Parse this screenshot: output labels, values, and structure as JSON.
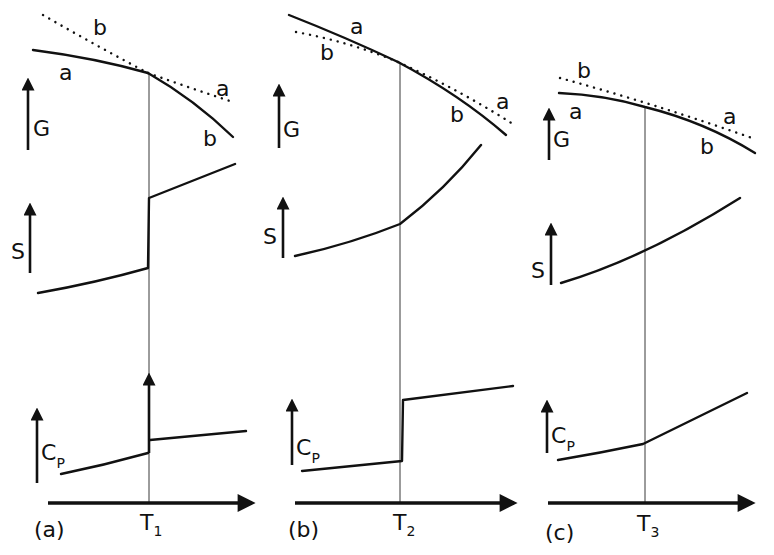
{
  "figure": {
    "panels": [
      {
        "id": "a",
        "label": "(a)",
        "transition_temp": {
          "symbol": "T",
          "subscript": "1"
        },
        "G": {
          "axis_label": "G",
          "curve_labels": {
            "solid_left": "a",
            "dotted_left": "b",
            "dotted_right": "a",
            "solid_right": "b"
          }
        },
        "S": {
          "axis_label": "S",
          "behavior": "discontinuous jump at T1"
        },
        "Cp": {
          "axis_label": "C",
          "axis_subscript": "P",
          "behavior": "delta-function spike (arrow) at T1"
        }
      },
      {
        "id": "b",
        "label": "(b)",
        "transition_temp": {
          "symbol": "T",
          "subscript": "2"
        },
        "G": {
          "axis_label": "G",
          "curve_labels": {
            "solid_left": "a",
            "dotted_left": "b",
            "dotted_right": "a",
            "solid_right": "b"
          }
        },
        "S": {
          "axis_label": "S",
          "behavior": "continuous, slope change at T2"
        },
        "Cp": {
          "axis_label": "C",
          "axis_subscript": "P",
          "behavior": "step discontinuity at T2"
        }
      },
      {
        "id": "c",
        "label": "(c)",
        "transition_temp": {
          "symbol": "T",
          "subscript": "3"
        },
        "G": {
          "axis_label": "G",
          "curve_labels": {
            "solid_left": "a",
            "dotted_left": "b",
            "dotted_right": "a",
            "solid_right": "b"
          }
        },
        "S": {
          "axis_label": "S",
          "behavior": "smooth through T3"
        },
        "Cp": {
          "axis_label": "C",
          "axis_subscript": "P",
          "behavior": "slope change at T3"
        }
      }
    ]
  }
}
